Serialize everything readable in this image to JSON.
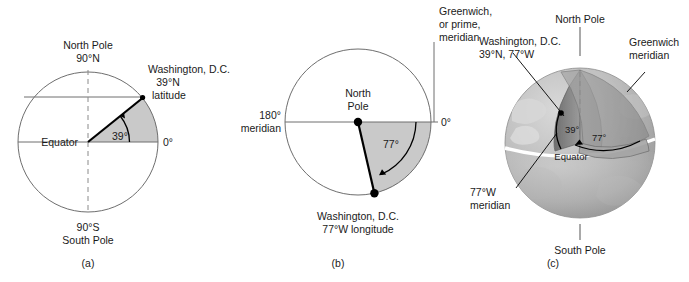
{
  "figure": {
    "background_color": "#ffffff",
    "line_color": "#6e6e6e",
    "accent_color": "#000000",
    "shade_color": "#c9c9c9"
  },
  "panel_a": {
    "caption": "(a)",
    "north_pole_line1": "North Pole",
    "north_pole_line2": "90°N",
    "south_pole_line1": "90°S",
    "south_pole_line2": "South Pole",
    "equator": "Equator",
    "zero_degrees": "0°",
    "angle": "39°",
    "city_line1": "Washington, D.C.",
    "city_line2": "39°N",
    "city_line3": "latitude"
  },
  "panel_b": {
    "caption": "(b)",
    "greenwich_line1": "Greenwich,",
    "greenwich_line2": "or prime,",
    "greenwich_line3": "meridian",
    "pole_line1": "North",
    "pole_line2": "Pole",
    "meridian180_line1": "180°",
    "meridian180_line2": "meridian",
    "zero_degrees": "0°",
    "angle": "77°",
    "city_line1": "Washington, D.C.",
    "city_line2": "77°W longitude"
  },
  "panel_c": {
    "caption": "(c)",
    "north_pole": "North Pole",
    "south_pole": "South Pole",
    "equator": "Equator",
    "city_line1": "Washington, D.C.",
    "city_line2": "39°N, 77°W",
    "greenwich_line1": "Greenwich",
    "greenwich_line2": "meridian",
    "wmeridian_line1": "77°W",
    "wmeridian_line2": "meridian",
    "angle_lat": "39°",
    "angle_lon": "77°"
  }
}
